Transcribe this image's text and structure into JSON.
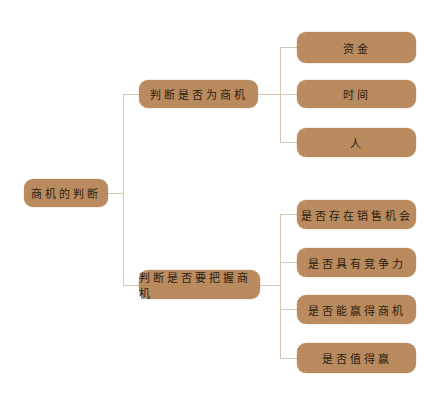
{
  "diagram": {
    "type": "mind-map",
    "colors": {
      "node_fill": "#b98a5d",
      "node_text": "#2b1d12",
      "connector": "#d7c7b3",
      "background": "#ffffff"
    },
    "root": {
      "label": "商机的判断",
      "children": [
        {
          "label": "判断是否为商机",
          "children": [
            {
              "label": "资金"
            },
            {
              "label": "时间"
            },
            {
              "label": "人"
            }
          ]
        },
        {
          "label": "判断是否要把握商机",
          "children": [
            {
              "label": "是否存在销售机会"
            },
            {
              "label": "是否具有竞争力"
            },
            {
              "label": "是否能赢得商机"
            },
            {
              "label": "是否值得赢"
            }
          ]
        }
      ]
    }
  }
}
